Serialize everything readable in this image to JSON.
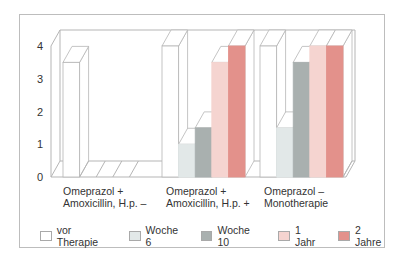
{
  "chart_data": {
    "type": "bar",
    "title": "",
    "xlabel": "",
    "ylabel": "",
    "ylim": [
      0,
      4
    ],
    "yticks": [
      0,
      1,
      2,
      3,
      4
    ],
    "grid": false,
    "style": "3d-grouped",
    "legend_position": "bottom",
    "categories": [
      "Omeprazol + Amoxicillin, H.p. –",
      "Omeprazol + Amoxicillin, H.p. +",
      "Omeprazol – Monotherapie"
    ],
    "series": [
      {
        "name": "vor Therapie",
        "color": "#ffffff",
        "values": [
          3.5,
          4,
          4
        ]
      },
      {
        "name": "Woche 6",
        "color": "#e2e8e8",
        "values": [
          0,
          1,
          1.5
        ]
      },
      {
        "name": "Woche 10",
        "color": "#a9b0af",
        "values": [
          0,
          1.5,
          3.5
        ]
      },
      {
        "name": "1 Jahr",
        "color": "#f5d4d0",
        "values": [
          0,
          3.5,
          4
        ]
      },
      {
        "name": "2 Jahre",
        "color": "#e3918b",
        "values": [
          0,
          4,
          4
        ]
      }
    ]
  },
  "axis": {
    "y_ticks": [
      "0",
      "1",
      "2",
      "3",
      "4"
    ]
  },
  "x_labels": [
    {
      "line1": "Omeprazol +",
      "line2": "Amoxicillin, H.p. –"
    },
    {
      "line1": "Omeprazol +",
      "line2": "Amoxicillin, H.p. +"
    },
    {
      "line1": "Omeprazol –",
      "line2": "Monotherapie"
    }
  ],
  "legend": [
    {
      "label": "vor Therapie",
      "color": "#ffffff"
    },
    {
      "label": "Woche 6",
      "color": "#e2e8e8"
    },
    {
      "label": "Woche 10",
      "color": "#a9b0af"
    },
    {
      "label": "1 Jahr",
      "color": "#f5d4d0"
    },
    {
      "label": "2 Jahre",
      "color": "#e3918b"
    }
  ]
}
